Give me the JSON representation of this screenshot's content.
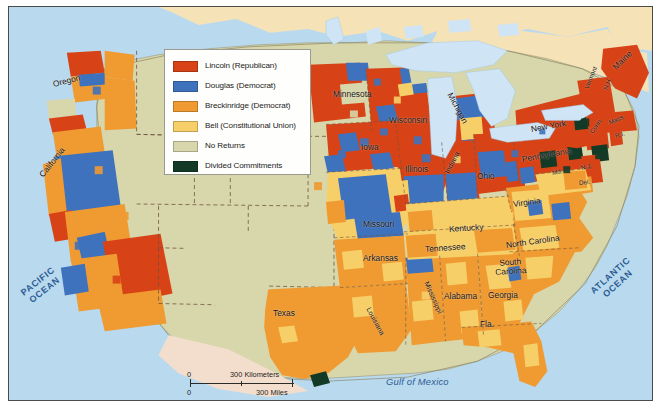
{
  "map": {
    "title": "Presidential Election of 1860",
    "frame_color": "#4a4a46",
    "page_background": "#ffffff"
  },
  "legend": {
    "background": "#fefefc",
    "border_color": "#9a9a90",
    "items": [
      {
        "label": "Lincoln (Republican)",
        "color": "#d74316",
        "key": "lincoln"
      },
      {
        "label": "Douglas (Democrat)",
        "color": "#3f72bc",
        "key": "douglas"
      },
      {
        "label": "Breckinridge (Democrat)",
        "color": "#ef9b32",
        "key": "breckinridge"
      },
      {
        "label": "Bell (Constitutional Union)",
        "color": "#f7cf68",
        "key": "bell"
      },
      {
        "label": "No Returns",
        "color": "#d8d6ab",
        "key": "no_returns"
      },
      {
        "label": "Divided Commitments",
        "color": "#133a27",
        "key": "divided"
      }
    ]
  },
  "colors": {
    "lincoln": "#d74316",
    "douglas": "#3f72bc",
    "breckinridge": "#ef9b32",
    "bell": "#f7cf68",
    "no_returns": "#d8d6ab",
    "divided": "#133a27",
    "ocean": "#b9d9ef",
    "lakes": "#cfe4f4",
    "canada": "#f6e2b7",
    "mexico": "#f3decd",
    "border_dash": "#6f5540"
  },
  "scalebar": {
    "km_zero": "0",
    "km_label": "300 Kilometers",
    "mi_zero": "0",
    "mi_label": "300 Miles"
  },
  "water_labels": {
    "pacific": "PACIFIC\nOCEAN",
    "pacific_line1": "PACIFIC",
    "pacific_line2": "OCEAN",
    "atlantic_line1": "ATLANTIC",
    "atlantic_line2": "OCEAN",
    "gulf": "Gulf of Mexico"
  },
  "state_labels": [
    {
      "name": "Oregon",
      "text": "Oregon",
      "x": 52,
      "y": 78,
      "rot": -14,
      "size": "n"
    },
    {
      "name": "California",
      "text": "California",
      "x": 40,
      "y": 170,
      "rot": -52,
      "size": "n"
    },
    {
      "name": "Texas",
      "text": "Texas",
      "x": 272,
      "y": 307,
      "rot": 0,
      "size": "n"
    },
    {
      "name": "Missouri",
      "text": "Missouri",
      "x": 362,
      "y": 218,
      "rot": 0,
      "size": "n"
    },
    {
      "name": "Arkansas",
      "text": "Arkansas",
      "x": 362,
      "y": 252,
      "rot": 0,
      "size": "n"
    },
    {
      "name": "Louisiana",
      "text": "Louisiana",
      "x": 367,
      "y": 303,
      "rot": 62,
      "size": "sm"
    },
    {
      "name": "Mississippi",
      "text": "Mississippi",
      "x": 425,
      "y": 277,
      "rot": 66,
      "size": "sm"
    },
    {
      "name": "Alabama",
      "text": "Alabama",
      "x": 443,
      "y": 290,
      "rot": 0,
      "size": "n"
    },
    {
      "name": "Georgia",
      "text": "Georgia",
      "x": 487,
      "y": 289,
      "rot": 0,
      "size": "n"
    },
    {
      "name": "Florida",
      "text": "Fla.",
      "x": 479,
      "y": 318,
      "rot": 0,
      "size": "n"
    },
    {
      "name": "Tennessee",
      "text": "Tennessee",
      "x": 424,
      "y": 243,
      "rot": -4,
      "size": "n"
    },
    {
      "name": "Kentucky",
      "text": "Kentucky",
      "x": 448,
      "y": 223,
      "rot": -4,
      "size": "n"
    },
    {
      "name": "NorthCarolina",
      "text": "North Carolina",
      "x": 505,
      "y": 239,
      "rot": -8,
      "size": "n"
    },
    {
      "name": "SouthCarolina",
      "text": "South\nCarolina",
      "x": 494,
      "y": 258,
      "rot": -4,
      "size": "n"
    },
    {
      "name": "Virginia",
      "text": "Virginia",
      "x": 512,
      "y": 198,
      "rot": -8,
      "size": "n"
    },
    {
      "name": "Ohio",
      "text": "Ohio",
      "x": 476,
      "y": 170,
      "rot": 0,
      "size": "n"
    },
    {
      "name": "Indiana",
      "text": "Indiana",
      "x": 446,
      "y": 168,
      "rot": -62,
      "size": "sm"
    },
    {
      "name": "Illinois",
      "text": "Illinois",
      "x": 404,
      "y": 163,
      "rot": 0,
      "size": "n"
    },
    {
      "name": "Iowa",
      "text": "Iowa",
      "x": 360,
      "y": 141,
      "rot": 0,
      "size": "n"
    },
    {
      "name": "Wisconsin",
      "text": "Wisconsin",
      "x": 388,
      "y": 114,
      "rot": 0,
      "size": "n"
    },
    {
      "name": "Minnesota",
      "text": "Minnesota",
      "x": 332,
      "y": 88,
      "rot": 0,
      "size": "n"
    },
    {
      "name": "Michigan",
      "text": "Michigan",
      "x": 449,
      "y": 87,
      "rot": 62,
      "size": "n"
    },
    {
      "name": "Pennsylvania",
      "text": "Pennsylvania",
      "x": 521,
      "y": 153,
      "rot": -10,
      "size": "n"
    },
    {
      "name": "NewYork",
      "text": "New York",
      "x": 530,
      "y": 123,
      "rot": -10,
      "size": "n"
    },
    {
      "name": "Maine",
      "text": "Maine",
      "x": 613,
      "y": 62,
      "rot": -44,
      "size": "n"
    },
    {
      "name": "NewHampshire",
      "text": "N.H.",
      "x": 604,
      "y": 85,
      "rot": -70,
      "size": "xs"
    },
    {
      "name": "Vermont",
      "text": "Vermont",
      "x": 585,
      "y": 84,
      "rot": -68,
      "size": "xs"
    },
    {
      "name": "Massachusetts",
      "text": "Mass.",
      "x": 608,
      "y": 118,
      "rot": -24,
      "size": "xs"
    },
    {
      "name": "Connecticut",
      "text": "Conn.",
      "x": 590,
      "y": 128,
      "rot": -56,
      "size": "xs"
    },
    {
      "name": "RhodeIsland",
      "text": "R.I.",
      "x": 614,
      "y": 131,
      "rot": -16,
      "size": "xs"
    },
    {
      "name": "NewJersey",
      "text": "N.J.",
      "x": 580,
      "y": 163,
      "rot": -14,
      "size": "xs"
    },
    {
      "name": "Maryland",
      "text": "Md.",
      "x": 551,
      "y": 168,
      "rot": -10,
      "size": "xs"
    },
    {
      "name": "Delaware",
      "text": "Del.",
      "x": 578,
      "y": 178,
      "rot": -6,
      "size": "xs"
    }
  ]
}
